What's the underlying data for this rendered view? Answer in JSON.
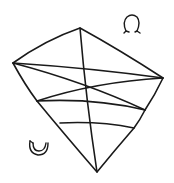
{
  "diagram": {
    "stroke_color": "#1a1a1a",
    "background": "#ffffff",
    "vertices": {
      "top": [
        80,
        28
      ],
      "right": [
        163,
        78
      ],
      "left": [
        13,
        63
      ],
      "left_lower": [
        37,
        101
      ],
      "right_lower": [
        145,
        110
      ],
      "right_lower2": [
        134,
        128
      ],
      "inner_left": [
        60,
        123
      ],
      "bottom": [
        97,
        172
      ]
    },
    "symbols": [
      {
        "name": "omega-symbol",
        "glyph": "Ω",
        "position": [
          132,
          25
        ]
      },
      {
        "name": "crescent-symbol",
        "glyph": "◡",
        "position": [
          38,
          145
        ]
      }
    ]
  }
}
